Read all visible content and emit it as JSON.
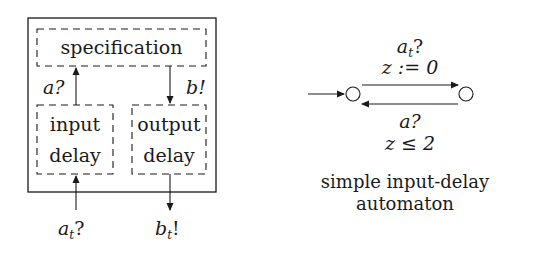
{
  "left_diagram": {
    "outer_box": "input-delay system",
    "specification_label": "specification",
    "input_delay_label": [
      "input",
      "delay"
    ],
    "output_delay_label": [
      "output",
      "delay"
    ],
    "internal_input_action": "a?",
    "internal_output_action": "b!",
    "external_input": {
      "base": "a",
      "sub": "t",
      "suffix": "?"
    },
    "external_output": {
      "base": "b",
      "sub": "t",
      "suffix": "!"
    }
  },
  "automaton": {
    "states": [
      {
        "id": "s0",
        "initial": true
      },
      {
        "id": "s1",
        "initial": false
      }
    ],
    "transitions": [
      {
        "from": "s0",
        "to": "s1",
        "action": {
          "base": "a",
          "sub": "t",
          "suffix": "?"
        },
        "update": "z := 0"
      },
      {
        "from": "s1",
        "to": "s0",
        "action_text": "a?",
        "guard": "z ≤ 2"
      }
    ],
    "caption": [
      "simple input-delay",
      "automaton"
    ]
  }
}
